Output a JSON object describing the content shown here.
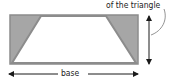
{
  "diagram": {
    "type": "trapezoid-in-rectangle",
    "labels": {
      "height_caption": "of the triangle",
      "base": "base"
    },
    "colors": {
      "shaded_triangles": "#a6a6a6",
      "outline": "#8c8c8c",
      "trapezoid_fill": "#ffffff",
      "arrows": "#1a1a1a"
    }
  }
}
